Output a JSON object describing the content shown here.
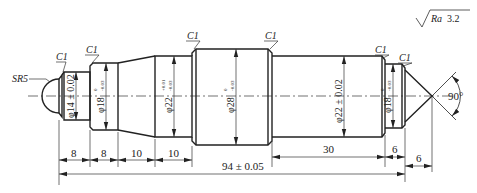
{
  "drawing": {
    "type": "shaft-part-drawing",
    "roughness": {
      "symbol": "surface-roughness-icon",
      "label": "Ra 3.2",
      "prefix": "Ra",
      "value": "3.2"
    },
    "sphere_radius": "SR5",
    "chamfers": [
      "C1",
      "C1",
      "C1",
      "C1",
      "C1",
      "C1"
    ],
    "diameters": [
      {
        "id": "d14",
        "label": "φ14 ± 0.02"
      },
      {
        "id": "d18_left",
        "label": "φ18",
        "upper": "0",
        "lower": "-0.03"
      },
      {
        "id": "d22_left",
        "label": "φ22",
        "upper": "+0.01",
        "lower": "-0.03"
      },
      {
        "id": "d28",
        "label": "φ28",
        "upper": "0",
        "lower": "-0.03"
      },
      {
        "id": "d22_right",
        "label": "φ22 ± 0.02"
      },
      {
        "id": "d18_right",
        "label": "φ18",
        "upper": "0",
        "lower": "-0.03"
      }
    ],
    "angle": "90°",
    "lengths": {
      "seg1": "8",
      "seg2": "8",
      "seg3": "10",
      "seg4": "10",
      "seg5": "30",
      "seg6": "6",
      "seg7": "6",
      "overall": "94 ± 0.05"
    }
  }
}
